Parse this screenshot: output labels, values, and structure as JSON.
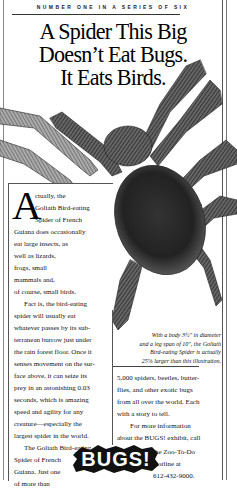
{
  "ad": {
    "kicker": "NUMBER ONE IN A SERIES OF SIX",
    "headline": [
      "A Spider This Big",
      "Doesn’t Eat Bugs.",
      "It Eats Birds."
    ],
    "dropcap": "A",
    "left_column_lines": [
      "ctually, the",
      "Goliath Bird-eating",
      "Spider of French",
      "Guiana does occasionally",
      "eat large insects, as",
      "well as lizards,",
      "frogs, small",
      "mammals and,",
      "of course, small birds.",
      "Fact is, the bird-eating",
      "spider will usually eat",
      "whatever passes by its sub-",
      "terranean burrow just under",
      "the rain forest floor. Once it",
      "senses movement on the sur-",
      "face above, it can seize its",
      "prey in an astonishing 0.03",
      "seconds, which is amazing",
      "speed and agility for any",
      "creature—especially the",
      "largest spider in the world.",
      "The Goliath Bird-eating",
      "Spider of French",
      "Guiana. Just one",
      "of more than"
    ],
    "caption_lines": [
      "With a body 3½\" in diameter",
      "and a leg span of 10\", the Goliath",
      "Bird-eating Spider is actually",
      "25% larger than this illustration."
    ],
    "right_column_lines": [
      "5,000 spiders, beetles, butter-",
      "flies, and other exotic bugs",
      "from all over the world. Each",
      "with a story to tell.",
      "For more information",
      "about the BUGS! exhibit, call",
      "the Zoo-To-Do",
      "Hotline at",
      "612-432-9000."
    ],
    "logo_text": "BUGS!",
    "illustration": "goliath-bird-eating-spider"
  }
}
